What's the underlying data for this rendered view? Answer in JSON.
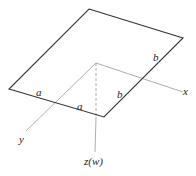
{
  "diagram": {
    "title": "",
    "plate": {
      "vertices": {
        "top": [
          89,
          9
        ],
        "right": [
          183,
          38
        ],
        "bottom": [
          104,
          117
        ],
        "left": [
          9,
          89
        ]
      },
      "stroke": "#333333"
    },
    "axes": {
      "origin": [
        96,
        63
      ],
      "x": {
        "label": "x",
        "end": [
          183,
          92
        ]
      },
      "y": {
        "label": "y",
        "end": [
          26,
          131
        ]
      },
      "z": {
        "label": "z(w)",
        "end": [
          95,
          152
        ]
      },
      "stroke": "#999999"
    },
    "edge_labels": {
      "a_left": "a",
      "a_right": "a",
      "b_lower": "b",
      "b_upper": "b"
    }
  }
}
